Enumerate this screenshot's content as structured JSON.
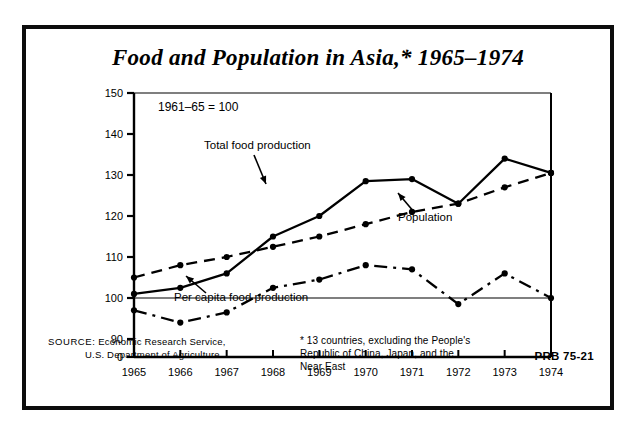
{
  "poster": {
    "title": "Food and Population in Asia,* 1965–1974",
    "prb_code": "PRB 75-21",
    "source_label": "SOURCE:",
    "source_line1": "Economic Research Service,",
    "source_line2": "U.S. Department of Agriculture",
    "footnote_line1": "* 13 countries, excluding the People's",
    "footnote_line2": "Republic of China, Japan, and the",
    "footnote_line3": "Near East",
    "index_note": "1961–65 = 100"
  },
  "chart_data": {
    "type": "line",
    "title": "Food and Population in Asia,* 1965–1974",
    "subtitle": "1961–65 = 100",
    "xlabel": "",
    "ylabel": "",
    "x": [
      1965,
      1966,
      1967,
      1968,
      1969,
      1970,
      1971,
      1972,
      1973,
      1974
    ],
    "categories": [
      "1965",
      "1966",
      "1967",
      "1968",
      "1969",
      "1970",
      "1971",
      "1972",
      "1973",
      "1974"
    ],
    "xlim": [
      1965,
      1974
    ],
    "ylim": [
      88,
      150
    ],
    "yticks": [
      0,
      90,
      100,
      110,
      120,
      130,
      140,
      150
    ],
    "ytick_labels": [
      "0",
      "90",
      "100",
      "110",
      "120",
      "130",
      "140",
      "150"
    ],
    "grid": false,
    "legend": "inline-annotations",
    "reference_line": 100,
    "series": [
      {
        "name": "Total food production",
        "style": "solid",
        "marker": "filled-circle",
        "values": [
          101,
          102.5,
          106,
          115,
          120,
          128.5,
          129,
          123,
          134,
          130.5
        ]
      },
      {
        "name": "Population",
        "style": "dashed",
        "marker": "filled-circle",
        "values": [
          105,
          108,
          110,
          112.5,
          115,
          118,
          121,
          123,
          127,
          130.5
        ]
      },
      {
        "name": "Per capita food production",
        "style": "dash-dot",
        "marker": "filled-circle",
        "values": [
          97,
          94,
          96.5,
          102.5,
          104.5,
          108,
          107,
          98.5,
          106,
          100
        ]
      }
    ],
    "annotations": [
      {
        "text": "Total food production",
        "points_to_series": "Total food production"
      },
      {
        "text": "Population",
        "points_to_series": "Population"
      },
      {
        "text": "Per capita food production",
        "points_to_series": "Per capita food production"
      }
    ]
  }
}
